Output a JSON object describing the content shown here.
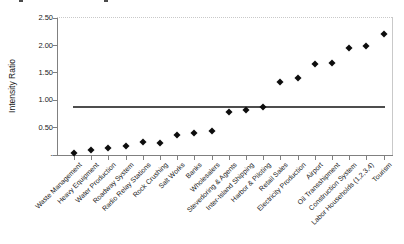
{
  "chart_data": {
    "type": "scatter",
    "title": "",
    "xlabel": "",
    "ylabel": "Intensity Ratio",
    "ylim": [
      0,
      2.5
    ],
    "grid": false,
    "legend": "none",
    "ytick_values": [
      0,
      0.5,
      1.0,
      1.5,
      2.0,
      2.5
    ],
    "ytick_labels": [
      "-",
      "0.50",
      "1.00",
      "1.50",
      "2.00",
      "2.50"
    ],
    "categories": [
      "Waste Management",
      "Heavy Equipment",
      "Water Production",
      "Roadway System",
      "Radio Relay Stations",
      "Rock Crushing",
      "Salt Works",
      "Banks",
      "Wholesalers",
      "Stevedoring & Agents",
      "Inter-Island Shipping",
      "Harbor & Piloting",
      "Retail Sales",
      "Electricity Production",
      "Airport",
      "Oil Transshipment",
      "Construction System",
      "Labor Households (1,2,3,4)",
      "Tourism"
    ],
    "series": [
      {
        "name": "Sector intensity ratio",
        "render": "points",
        "marker": "diamond",
        "values": [
          0.02,
          0.09,
          0.12,
          0.16,
          0.23,
          0.21,
          0.35,
          0.4,
          0.43,
          0.78,
          0.82,
          0.86,
          1.32,
          1.39,
          1.65,
          1.68,
          1.95,
          1.98,
          2.2
        ]
      },
      {
        "name": "Reference level",
        "render": "horizontal-line",
        "value": 0.87
      }
    ]
  },
  "colors": {
    "marker": "#0d0d0d",
    "reference_line": "#4d4d4d",
    "axis": "#808080",
    "plot_border": "#c9c9c9",
    "text": "#1a1a1a",
    "background": "#ffffff"
  }
}
